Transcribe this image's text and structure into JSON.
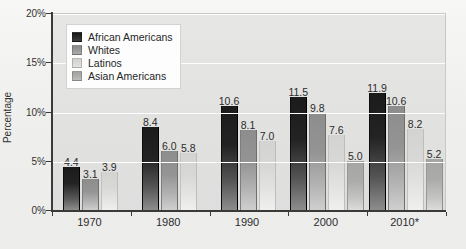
{
  "chart_data": {
    "type": "bar",
    "title": "",
    "xlabel": "",
    "ylabel": "Percentage",
    "ylim": [
      0,
      20
    ],
    "ytick_labels": [
      "0%",
      "5%",
      "10%",
      "15%",
      "20%"
    ],
    "ytick_values": [
      0,
      5,
      10,
      15,
      20
    ],
    "grid": true,
    "grid_orientation": "horizontal",
    "legend_position": "upper-left-inside",
    "categories": [
      "1970",
      "1980",
      "1990",
      "2000",
      "2010*"
    ],
    "series": [
      {
        "name": "African Americans",
        "color": "#1b1b1b",
        "values": [
          4.4,
          8.4,
          10.6,
          11.5,
          11.9
        ],
        "labels": [
          "4.4",
          "8.4",
          "10.6",
          "11.5",
          "11.9"
        ]
      },
      {
        "name": "Whites",
        "color": "#949494",
        "values": [
          3.1,
          6.0,
          8.1,
          9.8,
          10.6
        ],
        "labels": [
          "3.1",
          "6.0",
          "8.1",
          "9.8",
          "10.6"
        ]
      },
      {
        "name": "Latinos",
        "color": "#d8d8d6",
        "values": [
          3.9,
          5.8,
          7.0,
          7.6,
          8.2
        ],
        "labels": [
          "3.9",
          "5.8",
          "7.0",
          "7.6",
          "8.2"
        ]
      },
      {
        "name": "Asian Americans",
        "color": "#ababa9",
        "values": [
          null,
          null,
          null,
          5.0,
          5.2
        ],
        "labels": [
          "",
          "",
          "",
          "5.0",
          "5.2"
        ]
      }
    ]
  },
  "legend": {
    "items": [
      {
        "label": "African Americans"
      },
      {
        "label": "Whites"
      },
      {
        "label": "Latinos"
      },
      {
        "label": "Asian Americans"
      }
    ]
  },
  "axes": {
    "y_title": "Percentage",
    "y_ticks": [
      "20%",
      "15%",
      "10%",
      "5%",
      "0%"
    ],
    "x_ticks": [
      "1970",
      "1980",
      "1990",
      "2000",
      "2010*"
    ]
  }
}
